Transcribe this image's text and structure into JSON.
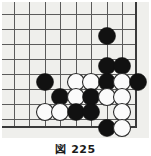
{
  "figure": {
    "kind": "go-board-diagram",
    "caption": "図 225",
    "background_color": "#efefec",
    "page_background": "#ffffff"
  },
  "board": {
    "label": "Go board corner diagram (bottom-right corner)",
    "colors": {
      "grid_line": "#5a5a5a",
      "border_line": "#3a3a3a",
      "black_stone": "#111111",
      "white_stone": "#fbfbfb",
      "white_stone_outline": "#2b2b2b",
      "surface": "#efefec"
    },
    "geometry": {
      "cols_x": [
        12,
        27,
        43,
        58,
        74,
        89,
        105,
        120,
        134
      ],
      "rows_y": [
        12,
        27,
        42,
        57,
        64,
        80,
        95,
        110,
        125
      ],
      "grid_x_lines": [
        12,
        27,
        43,
        58,
        74,
        89,
        105,
        120
      ],
      "grid_y_lines": [
        12,
        27,
        42,
        57,
        72,
        87,
        102,
        117
      ],
      "right_border_x": 134,
      "bottom_border_y": 125,
      "stone_radius": 8.5,
      "line_width": 1,
      "border_width": 2.4
    },
    "stones": [
      {
        "color": "black",
        "x": 105,
        "y": 34
      },
      {
        "color": "black",
        "x": 105,
        "y": 64
      },
      {
        "color": "black",
        "x": 120,
        "y": 64
      },
      {
        "color": "black",
        "x": 43,
        "y": 80
      },
      {
        "color": "white",
        "x": 74,
        "y": 80
      },
      {
        "color": "white",
        "x": 89,
        "y": 80
      },
      {
        "color": "black",
        "x": 105,
        "y": 80
      },
      {
        "color": "white",
        "x": 120,
        "y": 80
      },
      {
        "color": "black",
        "x": 136,
        "y": 80
      },
      {
        "color": "black",
        "x": 58,
        "y": 95
      },
      {
        "color": "white",
        "x": 74,
        "y": 95
      },
      {
        "color": "black",
        "x": 89,
        "y": 95
      },
      {
        "color": "white",
        "x": 105,
        "y": 95
      },
      {
        "color": "white",
        "x": 120,
        "y": 95
      },
      {
        "color": "white",
        "x": 43,
        "y": 110
      },
      {
        "color": "white",
        "x": 58,
        "y": 110
      },
      {
        "color": "black",
        "x": 74,
        "y": 110
      },
      {
        "color": "black",
        "x": 89,
        "y": 110
      },
      {
        "color": "white",
        "x": 120,
        "y": 110
      },
      {
        "color": "black",
        "x": 105,
        "y": 126
      },
      {
        "color": "white",
        "x": 120,
        "y": 126
      }
    ],
    "counts": {
      "black_stones": 11,
      "white_stones": 10,
      "total_stones": 21
    }
  }
}
